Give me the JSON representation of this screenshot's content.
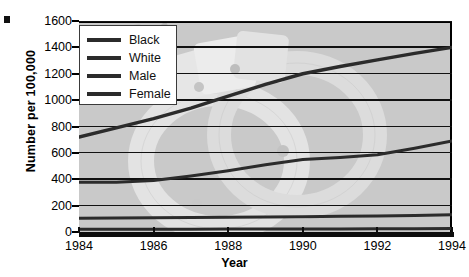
{
  "chart_data": {
    "type": "line",
    "title": "",
    "xlabel": "Year",
    "ylabel": "Number per 100,000",
    "x": [
      1984,
      1985,
      1986,
      1987,
      1988,
      1989,
      1990,
      1991,
      1992,
      1993,
      1994
    ],
    "xlim": [
      1984,
      1994
    ],
    "ylim": [
      0,
      1600
    ],
    "xticks": [
      "1984",
      "1986",
      "1988",
      "1990",
      "1992",
      "1994"
    ],
    "yticks": [
      "0",
      "200",
      "400",
      "600",
      "800",
      "1000",
      "1200",
      "1400",
      "1600"
    ],
    "grid": "horizontal",
    "legend_position": "upper-left",
    "plot_background": "#c9c9c9",
    "line_color": "#2b2b2b",
    "watermark": "handcuffs",
    "series": [
      {
        "name": "Black",
        "values": [
          720,
          790,
          860,
          940,
          1030,
          1120,
          1200,
          1255,
          1305,
          1355,
          1400
        ]
      },
      {
        "name": "White",
        "values": [
          105,
          106,
          108,
          110,
          112,
          114,
          116,
          119,
          122,
          126,
          130
        ]
      },
      {
        "name": "Male",
        "values": [
          378,
          378,
          390,
          425,
          465,
          510,
          550,
          565,
          585,
          635,
          690
        ]
      },
      {
        "name": "Female",
        "values": [
          20,
          20,
          21,
          21,
          22,
          22,
          23,
          23,
          24,
          25,
          26
        ]
      }
    ]
  },
  "legend": {
    "items": [
      {
        "label": "Black"
      },
      {
        "label": "White"
      },
      {
        "label": "Male"
      },
      {
        "label": "Female"
      }
    ]
  }
}
